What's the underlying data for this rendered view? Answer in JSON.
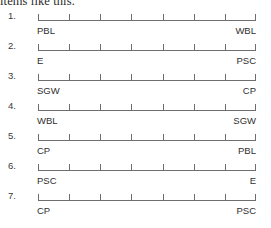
{
  "header": {
    "text": "items like this."
  },
  "scale": {
    "tick_count": 8,
    "segments": 7,
    "line_color": "#6e6e6e",
    "text_color": "#2f2f2f"
  },
  "items": [
    {
      "number": "1.",
      "left_anchor": "PBL",
      "right_anchor": "WBL"
    },
    {
      "number": "2.",
      "left_anchor": "E",
      "right_anchor": "PSC"
    },
    {
      "number": "3.",
      "left_anchor": "SGW",
      "right_anchor": "CP"
    },
    {
      "number": "4.",
      "left_anchor": "WBL",
      "right_anchor": "SGW"
    },
    {
      "number": "5.",
      "left_anchor": "CP",
      "right_anchor": "PBL"
    },
    {
      "number": "6.",
      "left_anchor": "PSC",
      "right_anchor": "E"
    },
    {
      "number": "7.",
      "left_anchor": "CP",
      "right_anchor": "PSC"
    }
  ]
}
